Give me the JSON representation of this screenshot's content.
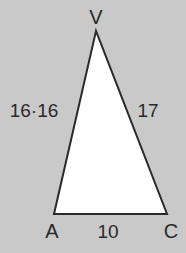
{
  "diagram": {
    "type": "triangle",
    "background": "#c9c9c9",
    "fill": "#ffffff",
    "stroke": "#2a2a2a",
    "vertices": {
      "V": {
        "label": "V",
        "x": 96,
        "y": 30
      },
      "A": {
        "label": "A",
        "x": 54,
        "y": 214
      },
      "C": {
        "label": "C",
        "x": 167,
        "y": 214
      }
    },
    "sides": {
      "VA": "16·16",
      "VC": "17",
      "AC": "10"
    }
  }
}
